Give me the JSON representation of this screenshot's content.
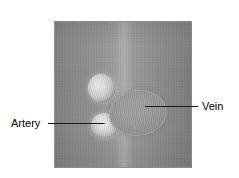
{
  "figure": {
    "type": "ultrasound-cross-section-diagram",
    "modality": "grayscale-ultrasound"
  },
  "panel": {
    "name": "ultrasound-scan-panel",
    "border_color": "#8a8a8a",
    "background_color": "#8e8e8e"
  },
  "structures": [
    {
      "id": "artery-upper",
      "name": "artery-upper",
      "appearance": "bright-echogenic-oval",
      "fill_color": "#dcdcdc"
    },
    {
      "id": "artery-lower",
      "name": "artery-lower",
      "appearance": "bright-echogenic-oval",
      "fill_color": "#e0e0e0"
    },
    {
      "id": "vein",
      "name": "vein",
      "appearance": "large-hypoechoic-oval",
      "fill_color": "#9a9a9a"
    }
  ],
  "annotations": {
    "artery": {
      "label": "Artery",
      "leader_line_color": "#1a1a1a",
      "side": "left"
    },
    "vein": {
      "label": "Vein",
      "leader_line_color": "#1a1a1a",
      "side": "right"
    }
  }
}
